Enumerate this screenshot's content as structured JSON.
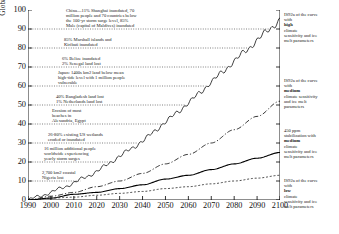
{
  "chart_data": {
    "type": "line",
    "title": "",
    "xlabel": "",
    "ylabel": "Global/Relative sea level rise [cm]",
    "xlim": [
      1990,
      2100
    ],
    "ylim": [
      0,
      100
    ],
    "xticks": [
      "1990",
      "2000",
      "2010",
      "2020",
      "2030",
      "2040",
      "2050",
      "2060",
      "2070",
      "2080",
      "2090",
      "2100"
    ],
    "yticks": [
      "0",
      "10",
      "20",
      "30",
      "40",
      "50",
      "60",
      "70",
      "80",
      "90",
      "100"
    ],
    "grid": false,
    "legend_position": "right-annotations",
    "series": [
      {
        "name": "IS92a of the curve with high climate sensitivity and ice melt parameters",
        "style": "dashed-with-tidal-oscillation",
        "x": [
          1990,
          2000,
          2010,
          2020,
          2030,
          2040,
          2050,
          2060,
          2070,
          2080,
          2090,
          2100
        ],
        "values": [
          0,
          4,
          9,
          15,
          23,
          31,
          41,
          51,
          62,
          73,
          84,
          95
        ]
      },
      {
        "name": "IS92a of the curve with medium climate sensitivity and ice melt parameters",
        "style": "dash-dot",
        "x": [
          1990,
          2000,
          2010,
          2020,
          2030,
          2040,
          2050,
          2060,
          2070,
          2080,
          2090,
          2100
        ],
        "values": [
          0,
          2,
          4,
          7,
          10,
          14,
          19,
          24,
          30,
          37,
          44,
          52
        ]
      },
      {
        "name": "450 ppm stabilization with medium climate sensitivity and ice melt parameters",
        "style": "solid",
        "x": [
          1990,
          2000,
          2010,
          2020,
          2030,
          2040,
          2050,
          2060,
          2070,
          2080,
          2090,
          2100
        ],
        "values": [
          0,
          1,
          3,
          4,
          6,
          8,
          11,
          13,
          16,
          19,
          22,
          25
        ]
      },
      {
        "name": "IS92a of the curve with low climate sensitivity and ice melt parameters",
        "style": "fine-dashed",
        "x": [
          1990,
          2000,
          2010,
          2020,
          2030,
          2040,
          2050,
          2060,
          2070,
          2080,
          2090,
          2100
        ],
        "values": [
          0,
          1,
          1.5,
          2.5,
          3.5,
          4.5,
          6,
          7,
          8.5,
          10,
          11.5,
          13
        ]
      }
    ],
    "impact_annotations": [
      {
        "level": 90,
        "lines": [
          "China—11% Shanghai inundated, 70",
          "million people and 70 countries below",
          "the 100-yr storm surge level, 85%",
          "Male (capital of Maldives) inundated"
        ]
      },
      {
        "level": 80,
        "lines": [
          "85% Marshall islands and",
          "Kiribati inundated"
        ]
      },
      {
        "level": 70,
        "lines": [
          "6% Belize inundated",
          "2% Senegal land lost"
        ]
      },
      {
        "level": 60,
        "lines": [
          "Japan: 1400s km2 land below mean",
          "high-tide level with 1 million people",
          "vulnerable"
        ]
      },
      {
        "level": 50,
        "lines": [
          "40% Bangladesh land lost",
          "1% Netherlands land lost"
        ]
      },
      {
        "level": 40,
        "lines": [
          "Erosion of most",
          "beaches in",
          "Alexandria, Egypt"
        ]
      },
      {
        "level": 30,
        "lines": [
          "26-80% existing US wetlands",
          "eroded or inundated"
        ]
      },
      {
        "level": 20,
        "lines": [
          "16 million additional people",
          "worldwide experiencing",
          "yearly storm surges"
        ]
      },
      {
        "level": 10,
        "lines": [
          "2,700 km2 coastal",
          "Nigeria lost"
        ]
      }
    ],
    "right_annotations": [
      {
        "lines": [
          "IS92a of the curve",
          "with ",
          "high",
          " climate",
          "sensitivity and ice",
          "melt parameters"
        ],
        "bold_word": "high",
        "level": 90
      },
      {
        "lines": [
          "IS92a of the curve",
          "with ",
          "medium",
          "climate sensitivity",
          "and ice melt",
          "parameters"
        ],
        "bold_word": "medium",
        "level": 52
      },
      {
        "lines": [
          "450 ppm",
          "stabilization with",
          "medium",
          " climate",
          "sensitivity and ice",
          "melt parameters"
        ],
        "bold_word": "medium",
        "level": 26
      },
      {
        "lines": [
          "IS92a of the curve",
          "with ",
          "low",
          " climate",
          "sensitivity and ice",
          "melt parameters"
        ],
        "bold_word": "low",
        "level": 12
      }
    ]
  }
}
